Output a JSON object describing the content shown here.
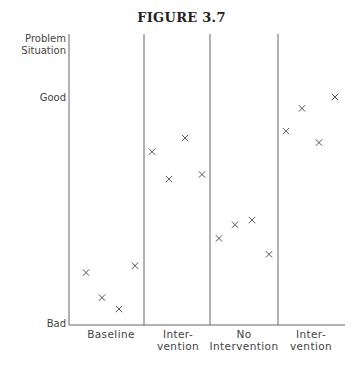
{
  "chart_data": {
    "type": "scatter",
    "title": "FIGURE 3.7",
    "ylabel": "Problem Situation",
    "xlabel": "",
    "y_ticks": [
      "Good",
      "Bad"
    ],
    "ylim": [
      0,
      100
    ],
    "grid": false,
    "legend": null,
    "phases": [
      {
        "label_lines": [
          "Baseline"
        ],
        "values": [
          23,
          12,
          7,
          26
        ]
      },
      {
        "label_lines": [
          "Inter-",
          "vention"
        ],
        "values": [
          76,
          64,
          82,
          66
        ]
      },
      {
        "label_lines": [
          "No",
          "Intervention"
        ],
        "values": [
          38,
          44,
          46,
          31
        ]
      },
      {
        "label_lines": [
          "Inter-",
          "vention"
        ],
        "values": [
          85,
          95,
          80,
          100
        ]
      }
    ],
    "marker": "x"
  },
  "figure": {
    "title": "FIGURE 3.7",
    "y_axis_label_line1": "Problem",
    "y_axis_label_line2": "Situation",
    "y_tick_good": "Good",
    "y_tick_bad": "Bad",
    "phase_labels": {
      "p1_l1": "Baseline",
      "p2_l1": "Inter-",
      "p2_l2": "vention",
      "p3_l1": "No",
      "p3_l2": "Intervention",
      "p4_l1": "Inter-",
      "p4_l2": "vention"
    }
  }
}
